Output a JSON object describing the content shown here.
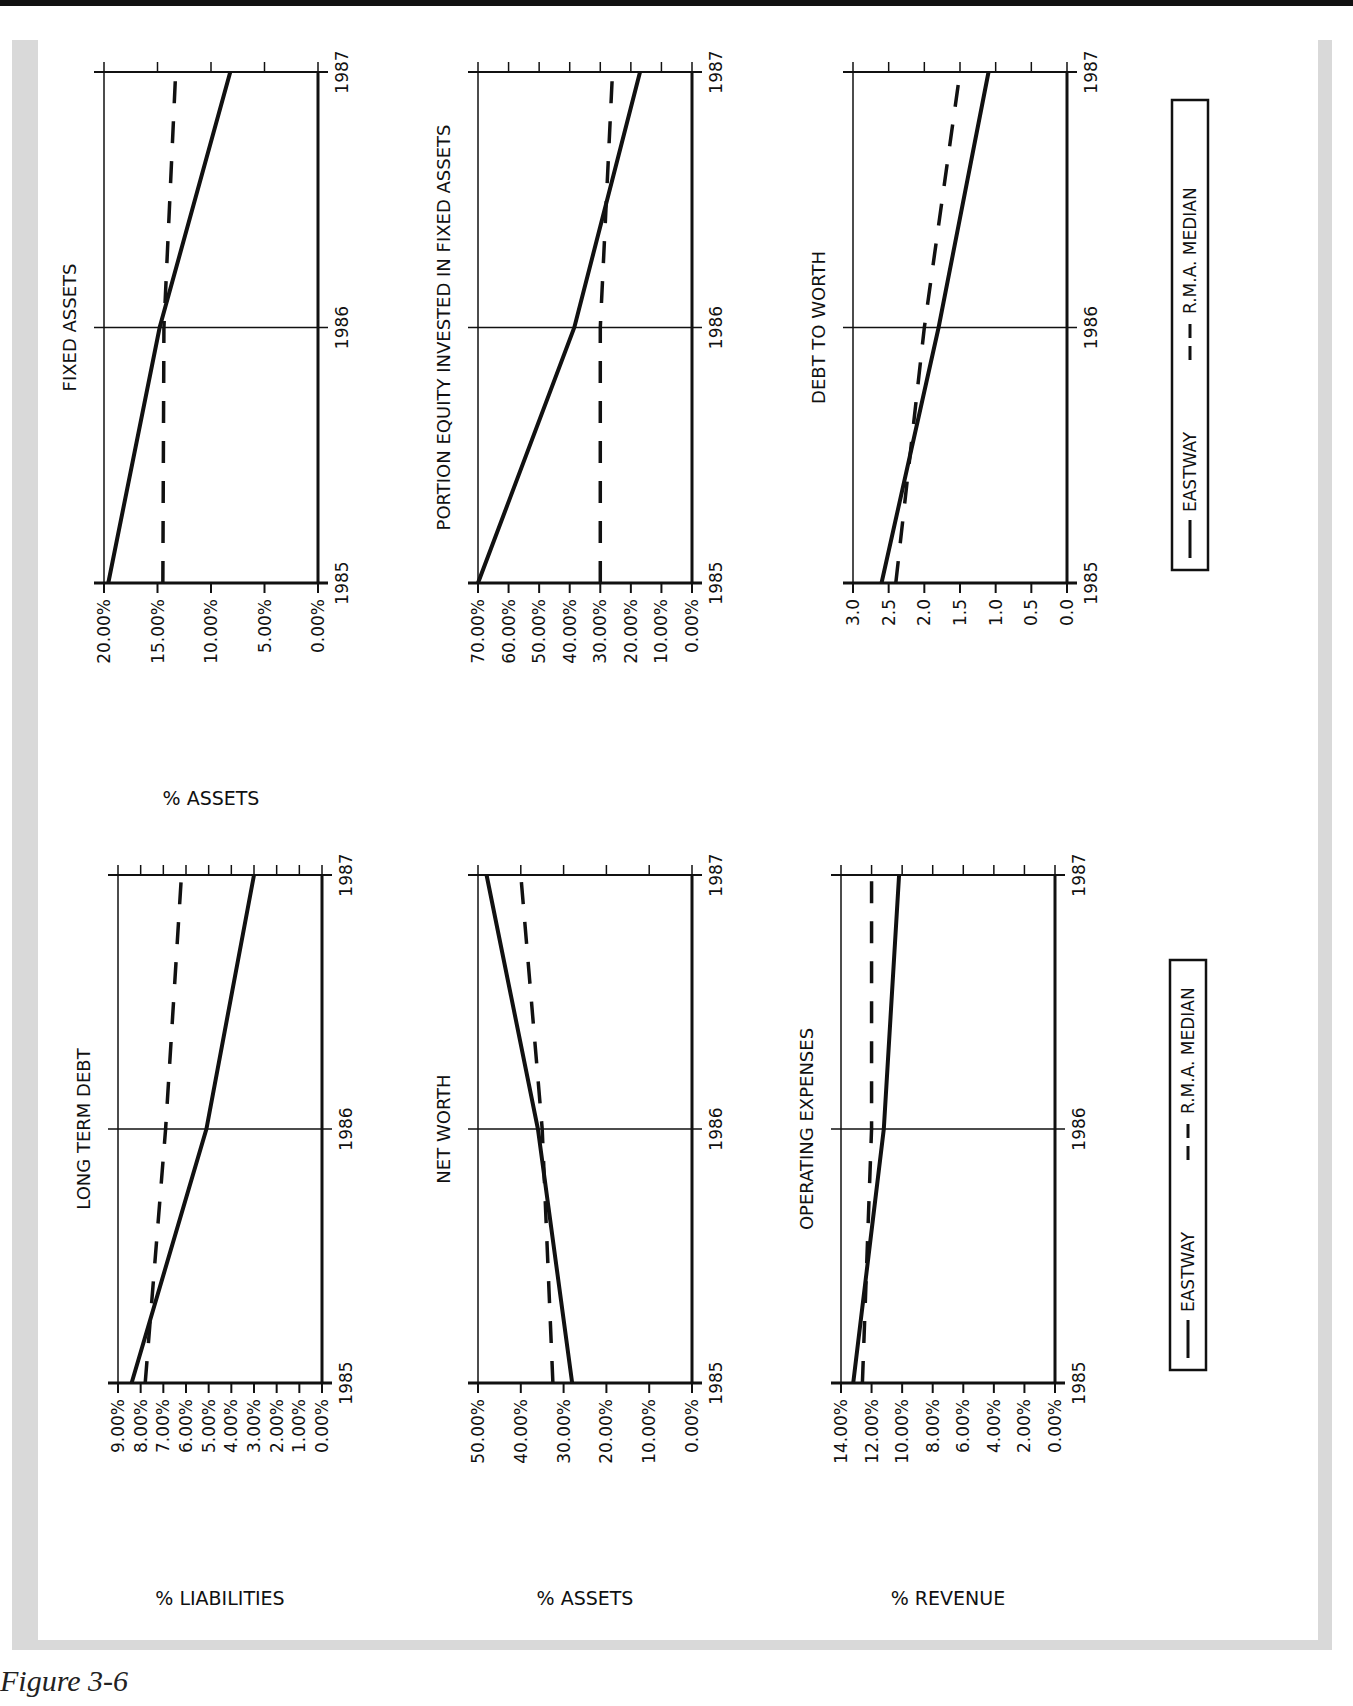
{
  "figure": {
    "caption": "Figure 3-6",
    "orientation": "rotated-90-landscape"
  },
  "legend": {
    "items": [
      {
        "label": "EASTWAY",
        "style": "solid"
      },
      {
        "label": "R.M.A. MEDIAN",
        "style": "dashed"
      }
    ]
  },
  "chart_data": [
    {
      "type": "line",
      "title": "LONG TERM DEBT",
      "ylabel": "% LIABILITIES",
      "xlabel": "",
      "categories": [
        "1985",
        "1986",
        "1987"
      ],
      "y_ticks": [
        "9.00%",
        "8.00%",
        "7.00%",
        "6.00%",
        "5.00%",
        "4.00%",
        "3.00%",
        "2.00%",
        "1.00%",
        "0.00%"
      ],
      "ylim": [
        0,
        9
      ],
      "series": [
        {
          "name": "EASTWAY",
          "values": [
            8.4,
            5.1,
            3.0
          ]
        },
        {
          "name": "R.M.A. MEDIAN",
          "values": [
            7.8,
            6.9,
            6.2
          ]
        }
      ]
    },
    {
      "type": "line",
      "title": "NET WORTH",
      "ylabel": "% ASSETS",
      "xlabel": "",
      "categories": [
        "1985",
        "1986",
        "1987"
      ],
      "y_ticks": [
        "50.00%",
        "40.00%",
        "30.00%",
        "20.00%",
        "10.00%",
        "0.00%"
      ],
      "ylim": [
        0,
        50
      ],
      "series": [
        {
          "name": "EASTWAY",
          "values": [
            28.0,
            36.0,
            48.0
          ]
        },
        {
          "name": "R.M.A. MEDIAN",
          "values": [
            32.5,
            35.0,
            40.0
          ]
        }
      ]
    },
    {
      "type": "line",
      "title": "OPERATING EXPENSES",
      "ylabel": "% REVENUE",
      "xlabel": "",
      "categories": [
        "1985",
        "1986",
        "1987"
      ],
      "y_ticks": [
        "14.00%",
        "12.00%",
        "10.00%",
        "8.00%",
        "6.00%",
        "4.00%",
        "2.00%",
        "0.00%"
      ],
      "ylim": [
        0,
        14
      ],
      "series": [
        {
          "name": "EASTWAY",
          "values": [
            13.2,
            11.2,
            10.2
          ]
        },
        {
          "name": "R.M.A. MEDIAN",
          "values": [
            12.6,
            12.0,
            12.0
          ]
        }
      ]
    },
    {
      "type": "line",
      "title": "FIXED ASSETS",
      "ylabel": "% ASSETS",
      "xlabel": "",
      "categories": [
        "1985",
        "1986",
        "1987"
      ],
      "y_ticks": [
        "20.00%",
        "15.00%",
        "10.00%",
        "5.00%",
        "0.00%"
      ],
      "ylim": [
        0,
        20
      ],
      "series": [
        {
          "name": "EASTWAY",
          "values": [
            19.6,
            14.8,
            8.2
          ]
        },
        {
          "name": "R.M.A. MEDIAN",
          "values": [
            14.5,
            14.4,
            13.3
          ]
        }
      ]
    },
    {
      "type": "line",
      "title": "PORTION EQUITY INVESTED IN FIXED ASSETS",
      "ylabel": "",
      "xlabel": "",
      "categories": [
        "1985",
        "1986",
        "1987"
      ],
      "y_ticks": [
        "70.00%",
        "60.00%",
        "50.00%",
        "40.00%",
        "30.00%",
        "20.00%",
        "10.00%",
        "0.00%"
      ],
      "ylim": [
        0,
        70
      ],
      "series": [
        {
          "name": "EASTWAY",
          "values": [
            70.0,
            38.5,
            17.0
          ]
        },
        {
          "name": "R.M.A. MEDIAN",
          "values": [
            30.0,
            30.0,
            26.0
          ]
        }
      ]
    },
    {
      "type": "line",
      "title": "DEBT TO WORTH",
      "ylabel": "",
      "xlabel": "",
      "categories": [
        "1985",
        "1986",
        "1987"
      ],
      "y_ticks": [
        "3.0",
        "2.5",
        "2.0",
        "1.5",
        "1.0",
        "0.5",
        "0.0"
      ],
      "ylim": [
        0,
        3
      ],
      "series": [
        {
          "name": "EASTWAY",
          "values": [
            2.6,
            1.8,
            1.1
          ]
        },
        {
          "name": "R.M.A. MEDIAN",
          "values": [
            2.4,
            2.0,
            1.5
          ]
        }
      ]
    }
  ]
}
